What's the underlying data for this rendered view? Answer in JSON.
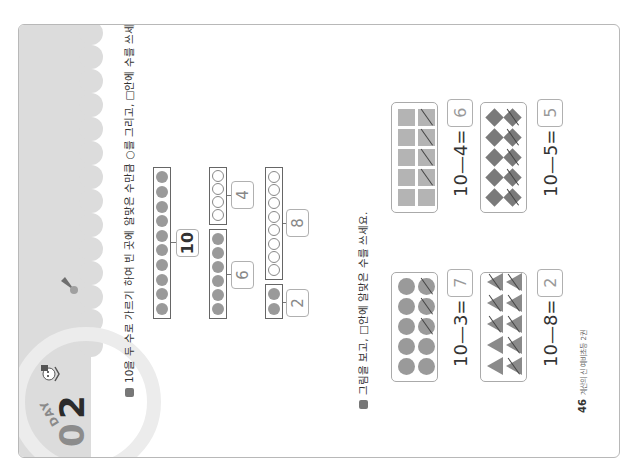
{
  "page": {
    "orientation": "rotated-90-ccw",
    "badge": {
      "day_label": "DAY",
      "number_first": "0",
      "number_second": "2",
      "ring_color": "#8c8c8c",
      "number_color": "#2b2b2b"
    },
    "header_color": "#dcdcdc"
  },
  "section1": {
    "instruction": "10을 두 수로 가르기 하여 빈 곳에 알맞은 수만큼 ○를 그리고, □안에 수를 쓰세요.",
    "whole": {
      "value": "10",
      "filled_dots": 10
    },
    "splits": [
      {
        "filled_part": {
          "label": "6",
          "filled_dots": 6
        },
        "drawn_part": {
          "label": "4",
          "empty_dots": 4
        }
      },
      {
        "filled_part": {
          "label": "2",
          "filled_dots": 2
        },
        "drawn_part": {
          "label": "8",
          "empty_dots": 8
        }
      }
    ]
  },
  "section2": {
    "instruction": "그림을 보고, □안에 알맞은 수를 쓰세요.",
    "problems": [
      {
        "shape": "circle",
        "total": 10,
        "crossed": 3,
        "minuend": "10",
        "subtrahend": "3",
        "answer": "7",
        "minus": "—",
        "equals": "="
      },
      {
        "shape": "triangle",
        "total": 10,
        "crossed": 8,
        "minuend": "10",
        "subtrahend": "8",
        "answer": "2",
        "minus": "—",
        "equals": "="
      },
      {
        "shape": "square",
        "total": 10,
        "crossed": 4,
        "minuend": "10",
        "subtrahend": "4",
        "answer": "6",
        "minus": "—",
        "equals": "="
      },
      {
        "shape": "diamond",
        "total": 10,
        "crossed": 5,
        "minuend": "10",
        "subtrahend": "5",
        "answer": "5",
        "minus": "—",
        "equals": "="
      }
    ]
  },
  "footer": {
    "page_number": "46",
    "book_title": "계산의 신 예비초등 2권"
  }
}
